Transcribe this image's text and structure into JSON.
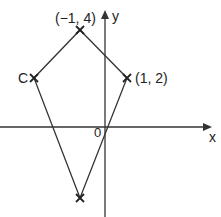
{
  "diagram": {
    "type": "kite on coordinate axes",
    "axes": {
      "x_label": "x",
      "y_label": "y",
      "origin_label": "0"
    },
    "points": [
      {
        "id": "top",
        "label": "(−1, 4)"
      },
      {
        "id": "C",
        "label": "C"
      },
      {
        "id": "right",
        "label": "(1, 2)"
      },
      {
        "id": "bottom",
        "label": ""
      }
    ]
  }
}
